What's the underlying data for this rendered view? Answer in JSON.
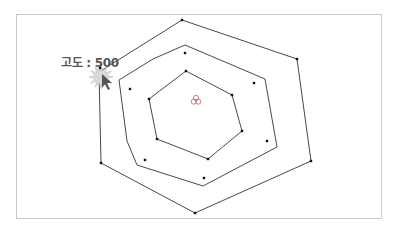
{
  "diagram": {
    "type": "contour-map",
    "tooltip_label": "고도 : 500",
    "colors": {
      "line": "#333333",
      "point": "#111111",
      "frame": "#c8c8c8",
      "label": "#555555",
      "center_icon": "#c07070",
      "cursor": "#555555",
      "burst": "#d9d9d9"
    },
    "contours": [
      {
        "name": "outer",
        "points": [
          [
            182,
            20
          ],
          [
            297,
            59
          ],
          [
            311,
            161
          ],
          [
            195,
            213
          ],
          [
            101,
            163
          ],
          [
            99,
            72
          ]
        ]
      },
      {
        "name": "middle",
        "points": [
          [
            185,
            45
          ],
          [
            265,
            79
          ],
          [
            277,
            147
          ],
          [
            203,
            186
          ],
          [
            137,
            165
          ],
          [
            127,
            141
          ],
          [
            119,
            80
          ],
          [
            153,
            59
          ]
        ]
      },
      {
        "name": "inner",
        "points": [
          [
            186,
            71
          ],
          [
            232,
            95
          ],
          [
            242,
            131
          ],
          [
            208,
            159
          ],
          [
            157,
            139
          ],
          [
            149,
            99
          ]
        ]
      }
    ],
    "isolated_points": [
      [
        185,
        53
      ],
      [
        254,
        83
      ],
      [
        130,
        89
      ],
      [
        267,
        141
      ],
      [
        145,
        160
      ],
      [
        204,
        178
      ]
    ],
    "center_icon": [
      196,
      100
    ],
    "cursor_point": [
      100,
      68
    ]
  }
}
